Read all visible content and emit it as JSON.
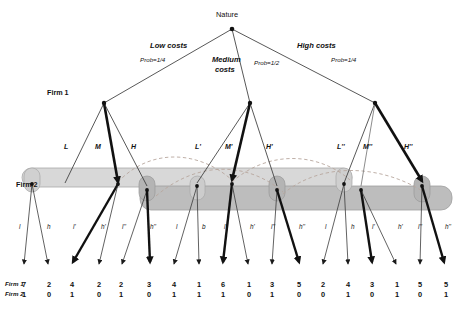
{
  "figure": {
    "type": "extensive-form-game-tree",
    "title_visible": false,
    "colors": {
      "line": "#2b2b2b",
      "bold_line": "#111111",
      "infoset_upper_fill": "#d8d8d8",
      "infoset_lower_fill": "#bcbcbc",
      "infoset_stroke": "#9a9a9a",
      "dashed_arc": "#b9a9a0",
      "text": "#111111"
    }
  },
  "nature": {
    "label": "Nature",
    "branches": [
      {
        "name": "Low costs",
        "prob": "Prob=1/4"
      },
      {
        "name": "Medium costs",
        "prob": "Prob=1/2"
      },
      {
        "name": "High costs",
        "prob": "Prob=1/4"
      }
    ],
    "medium_label_line1": "Medium",
    "medium_label_line2": "costs"
  },
  "players": {
    "firm1": "Firm 1",
    "firm2": "Firm 2",
    "payoff_row1": "Firm 1",
    "payoff_row2": "Firm 2"
  },
  "firm1_actions": {
    "low": [
      "L",
      "M",
      "H"
    ],
    "medium": [
      "L'",
      "M'",
      "H'"
    ],
    "high": [
      "L''",
      "M''",
      "H''"
    ]
  },
  "firm2_actions": [
    [
      "l",
      "h"
    ],
    [
      "l'",
      "h'"
    ],
    [
      "l''",
      "h''"
    ],
    [
      "l",
      "b"
    ],
    [
      "l'",
      "h'"
    ],
    [
      "l''",
      "h''"
    ],
    [
      "l",
      "h"
    ],
    [
      "l'",
      "h'"
    ],
    [
      "l''",
      "h''"
    ]
  ],
  "payoffs": [
    {
      "firm1": "7",
      "firm2": "1"
    },
    {
      "firm1": "2",
      "firm2": "0"
    },
    {
      "firm1": "4",
      "firm2": "1"
    },
    {
      "firm1": "2",
      "firm2": "0"
    },
    {
      "firm1": "2",
      "firm2": "1"
    },
    {
      "firm1": "3",
      "firm2": "0"
    },
    {
      "firm1": "4",
      "firm2": "1"
    },
    {
      "firm1": "1",
      "firm2": "1"
    },
    {
      "firm1": "6",
      "firm2": "1"
    },
    {
      "firm1": "1",
      "firm2": "0"
    },
    {
      "firm1": "3",
      "firm2": "1"
    },
    {
      "firm1": "5",
      "firm2": "0"
    },
    {
      "firm1": "2",
      "firm2": "0"
    },
    {
      "firm1": "4",
      "firm2": "1"
    },
    {
      "firm1": "3",
      "firm2": "0"
    },
    {
      "firm1": "1",
      "firm2": "1"
    },
    {
      "firm1": "5",
      "firm2": "0"
    },
    {
      "firm1": "5",
      "firm2": "1"
    }
  ],
  "equilibrium_path": {
    "description": "bold branches",
    "firm1_bold": [
      "M",
      "M'",
      "H''"
    ],
    "firm2_bold": [
      "l'",
      "h''",
      "l'",
      "h''",
      "l'",
      "h''"
    ]
  }
}
